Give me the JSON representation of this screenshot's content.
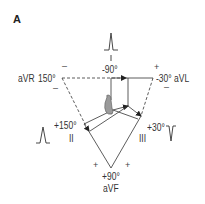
{
  "panel": {
    "label": "A"
  },
  "leads": {
    "I": {
      "name": "I",
      "angle": "-90°"
    },
    "II": {
      "name": "II",
      "angle": "+150°"
    },
    "III": {
      "name": "III",
      "angle": "+30°"
    },
    "aVR": {
      "name": "aVR",
      "angle": "150°"
    },
    "aVL": {
      "name": "aVL",
      "angle": "-30°",
      "full": "-30° aVL"
    },
    "aVF": {
      "name": "aVF",
      "angle": "+90°"
    }
  },
  "signs": {
    "top_left_minus": "–",
    "top_right_plus": "+",
    "aVR_minus": "–",
    "aVL_minus": "–",
    "bottom_left_plus": "+",
    "bottom_right_plus": "+"
  },
  "colors": {
    "line": "#333333",
    "heart": "#9a9a9a",
    "background": "#ffffff"
  }
}
